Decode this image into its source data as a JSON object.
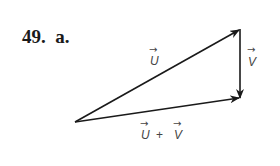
{
  "problem": {
    "number": "49.",
    "part": "a."
  },
  "diagram": {
    "type": "vector-addition-triangle",
    "vectors": [
      {
        "name": "u",
        "label": "U",
        "from": [
          75,
          122
        ],
        "to": [
          240,
          29
        ]
      },
      {
        "name": "v",
        "label": "V",
        "from": [
          240,
          29
        ],
        "to": [
          240,
          98
        ]
      },
      {
        "name": "u-plus-v",
        "label": "U + V",
        "from": [
          75,
          122
        ],
        "to": [
          240,
          98
        ]
      }
    ],
    "labels": {
      "u": "U",
      "v": "V",
      "sum_u": "U",
      "sum_plus": "+",
      "sum_v": "V",
      "arrow_glyph": "→"
    },
    "stroke_color": "#1a1a1a"
  }
}
